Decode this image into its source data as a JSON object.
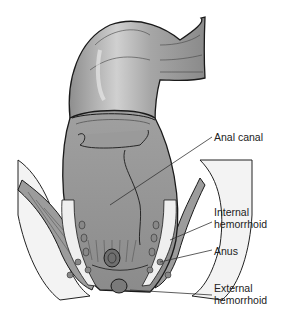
{
  "figure": {
    "labels": [
      {
        "id": "anal-canal",
        "text": "Anal canal"
      },
      {
        "id": "internal-hemorrhoid",
        "text": "Internal\nhemorrhoid"
      },
      {
        "id": "anus",
        "text": "Anus"
      },
      {
        "id": "external-hemorrhoid",
        "text": "External\nhemorrhoid"
      }
    ],
    "colors": {
      "tissue": "#a9a9a9",
      "tissue_dark": "#7d7d7d",
      "outline": "#1a1a1a",
      "fat": "#f2f2f2",
      "background": "#ffffff"
    }
  }
}
